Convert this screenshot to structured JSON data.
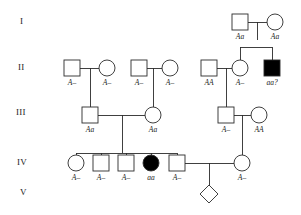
{
  "figure": {
    "type": "pedigree-chart",
    "title": "",
    "stroke_color": "#2b2b2b",
    "affected_fill": "#000000",
    "unaffected_fill": "#ffffff"
  },
  "generations": [
    {
      "label": "I",
      "x": 20,
      "y": 22
    },
    {
      "label": "II",
      "x": 18,
      "y": 68
    },
    {
      "label": "III",
      "x": 16,
      "y": 113
    },
    {
      "label": "IV",
      "x": 17,
      "y": 163
    },
    {
      "label": "V",
      "x": 20,
      "y": 193
    }
  ],
  "individuals": [
    {
      "id": "I-1",
      "shape": "square",
      "sex": "male",
      "affected": false,
      "cx": 240,
      "cy": 22,
      "genotype": "Aa",
      "label_y": 38
    },
    {
      "id": "I-2",
      "shape": "circle",
      "sex": "female",
      "affected": false,
      "cx": 275,
      "cy": 22,
      "genotype": "Aa",
      "label_y": 38
    },
    {
      "id": "II-1",
      "shape": "square",
      "sex": "male",
      "affected": false,
      "cx": 72,
      "cy": 68,
      "genotype": "A–",
      "label_y": 84
    },
    {
      "id": "II-2",
      "shape": "circle",
      "sex": "female",
      "affected": false,
      "cx": 107,
      "cy": 68,
      "genotype": "A–",
      "label_y": 84
    },
    {
      "id": "II-3",
      "shape": "square",
      "sex": "male",
      "affected": false,
      "cx": 139,
      "cy": 68,
      "genotype": "A–",
      "label_y": 84
    },
    {
      "id": "II-4",
      "shape": "circle",
      "sex": "female",
      "affected": false,
      "cx": 170,
      "cy": 68,
      "genotype": "A–",
      "label_y": 84
    },
    {
      "id": "II-5",
      "shape": "square",
      "sex": "male",
      "affected": false,
      "cx": 209,
      "cy": 68,
      "genotype": "AA",
      "label_y": 84
    },
    {
      "id": "II-6",
      "shape": "circle",
      "sex": "female",
      "affected": false,
      "cx": 240,
      "cy": 68,
      "genotype": "A–",
      "label_y": 84
    },
    {
      "id": "II-7",
      "shape": "square",
      "sex": "male",
      "affected": true,
      "cx": 272,
      "cy": 68,
      "genotype": "aa?",
      "label_y": 84
    },
    {
      "id": "III-1",
      "shape": "square",
      "sex": "male",
      "affected": false,
      "cx": 90,
      "cy": 115,
      "genotype": "Aa",
      "label_y": 131
    },
    {
      "id": "III-2",
      "shape": "circle",
      "sex": "female",
      "affected": false,
      "cx": 153,
      "cy": 115,
      "genotype": "Aa",
      "label_y": 131
    },
    {
      "id": "III-3",
      "shape": "square",
      "sex": "male",
      "affected": false,
      "cx": 226,
      "cy": 115,
      "genotype": "A–",
      "label_y": 131
    },
    {
      "id": "III-4",
      "shape": "circle",
      "sex": "female",
      "affected": false,
      "cx": 259,
      "cy": 115,
      "genotype": "AA",
      "label_y": 131
    },
    {
      "id": "IV-1",
      "shape": "circle",
      "sex": "female",
      "affected": false,
      "cx": 76,
      "cy": 163,
      "genotype": "A–",
      "label_y": 179
    },
    {
      "id": "IV-2",
      "shape": "square",
      "sex": "male",
      "affected": false,
      "cx": 101,
      "cy": 163,
      "genotype": "A–",
      "label_y": 179
    },
    {
      "id": "IV-3",
      "shape": "square",
      "sex": "male",
      "affected": false,
      "cx": 126,
      "cy": 163,
      "genotype": "A–",
      "label_y": 179
    },
    {
      "id": "IV-4",
      "shape": "circle",
      "sex": "female",
      "affected": true,
      "cx": 151,
      "cy": 163,
      "genotype": "aa",
      "label_y": 179
    },
    {
      "id": "IV-5",
      "shape": "square",
      "sex": "male",
      "affected": false,
      "cx": 177,
      "cy": 163,
      "genotype": "A–",
      "label_y": 179
    },
    {
      "id": "IV-6",
      "shape": "circle",
      "sex": "female",
      "affected": false,
      "cx": 242,
      "cy": 163,
      "genotype": "A–",
      "label_y": 179
    },
    {
      "id": "V-1",
      "shape": "diamond",
      "sex": "unknown",
      "affected": false,
      "cx": 209,
      "cy": 194,
      "genotype": "",
      "label_y": 210
    }
  ],
  "matings": [
    {
      "id": "mate-I",
      "partner_a": "I-1",
      "partner_b": "I-2",
      "y": 22,
      "x1": 248,
      "x2": 267,
      "drop_x": 257,
      "drop_y": 40
    },
    {
      "id": "mate-II-a",
      "partner_a": "II-1",
      "partner_b": "II-2",
      "y": 68,
      "x1": 80,
      "x2": 99,
      "drop_x": 90,
      "drop_y": 107
    },
    {
      "id": "mate-II-b",
      "partner_a": "II-3",
      "partner_b": "II-4",
      "y": 68,
      "x1": 147,
      "x2": 162,
      "drop_x": 153,
      "drop_y": 107
    },
    {
      "id": "mate-II-c",
      "partner_a": "II-5",
      "partner_b": "II-6",
      "y": 68,
      "x1": 217,
      "x2": 232,
      "drop_x": 226,
      "drop_y": 107
    },
    {
      "id": "mate-III-a",
      "partner_a": "III-1",
      "partner_b": "III-2",
      "y": 115,
      "x1": 98,
      "x2": 145,
      "drop_x": 122,
      "drop_y": 153
    },
    {
      "id": "mate-III-b",
      "partner_a": "III-3",
      "partner_b": "III-4",
      "y": 115,
      "x1": 234,
      "x2": 251,
      "drop_x": 242,
      "drop_y": 153
    },
    {
      "id": "mate-IV",
      "partner_a": "IV-5",
      "partner_b": "IV-6",
      "y": 163,
      "x1": 185,
      "x2": 234,
      "drop_x": 209,
      "drop_y": 186
    }
  ],
  "sibships": [
    {
      "id": "sibship-I",
      "bar_y": 47,
      "x_from": 240,
      "x_to": 272,
      "parent_drop_x": 257,
      "parent_y": 30
    },
    {
      "id": "sibship-II-a",
      "bar_y": 107,
      "x_from": 90,
      "x_to": 90,
      "parent_drop_x": 90,
      "parent_y": 76
    },
    {
      "id": "sibship-II-b",
      "bar_y": 107,
      "x_from": 153,
      "x_to": 153,
      "parent_drop_x": 153,
      "parent_y": 76
    },
    {
      "id": "sibship-II-c",
      "bar_y": 107,
      "x_from": 226,
      "x_to": 226,
      "parent_drop_x": 226,
      "parent_y": 76
    },
    {
      "id": "sibship-III-a",
      "bar_y": 153,
      "x_from": 76,
      "x_to": 177,
      "parent_drop_x": 122,
      "parent_y": 123
    },
    {
      "id": "sibship-III-b",
      "bar_y": 153,
      "x_from": 242,
      "x_to": 242,
      "parent_drop_x": 242,
      "parent_y": 123
    },
    {
      "id": "sibship-IV",
      "bar_y": 186,
      "x_from": 209,
      "x_to": 209,
      "parent_drop_x": 209,
      "parent_y": 171
    }
  ],
  "legend_notes": {
    "affected_meaning": "filled symbol = affected",
    "unknown_sex": "diamond = sex unspecified"
  }
}
